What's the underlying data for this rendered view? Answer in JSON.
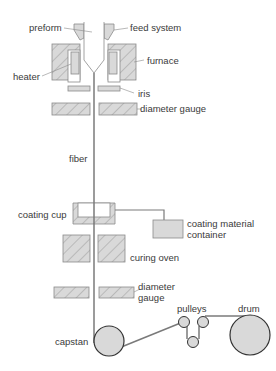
{
  "colors": {
    "fill": "#d9d9d9",
    "stroke": "#8a8a8a",
    "fiber": "#7a7a7a",
    "dark_stroke": "#333333",
    "text": "#3a3a3a"
  },
  "labels": {
    "preform": "preform",
    "feed_system": "feed system",
    "heater": "heater",
    "furnace": "furnace",
    "iris": "iris",
    "diameter_gauge_top": "diameter gauge",
    "fiber": "fiber",
    "coating_cup": "coating cup",
    "coating_material_container_line1": "coating material",
    "coating_material_container_line2": "container",
    "curing_oven": "curing oven",
    "diameter_gauge_bottom_line1": "diameter",
    "diameter_gauge_bottom_line2": "gauge",
    "capstan": "capstan",
    "pulleys": "pulleys",
    "drum": "drum"
  }
}
